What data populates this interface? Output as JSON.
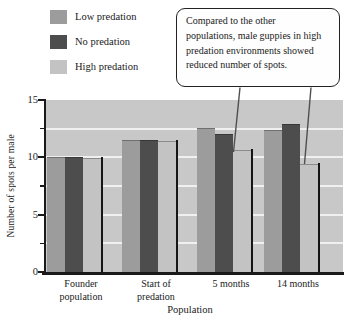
{
  "callout": {
    "text": "Compared to the other populations, male guppies in high predation environments showed reduced number of spots.",
    "lines": [
      "Compared to the other",
      "populations, male guppies in high",
      "predation environments showed",
      "reduced number of spots."
    ]
  },
  "chart_data": {
    "type": "bar",
    "title": "",
    "xlabel": "Population",
    "ylabel": "Number of spots per male",
    "ylim": [
      0,
      15
    ],
    "yticks": [
      0,
      5,
      10,
      15
    ],
    "ytick_labels": [
      "0",
      "5",
      "10",
      "15"
    ],
    "minor_ticks": [
      2.5,
      7.5,
      12.5
    ],
    "gridlines": [
      2.5,
      5,
      7.5,
      10,
      12.5
    ],
    "gridline_color": "#f0f0f0",
    "plot_background": "#c8c8c8",
    "grid": "on",
    "legend_position": "top-left",
    "categories": [
      "Founder population",
      "Start of predation",
      "5 months",
      "14 months"
    ],
    "series": [
      {
        "name": "Low predation",
        "color": "#9c9c9c",
        "values": [
          10.0,
          11.5,
          12.6,
          12.4
        ]
      },
      {
        "name": "No predation",
        "color": "#4d4d4d",
        "values": [
          10.0,
          11.5,
          12.0,
          12.9
        ]
      },
      {
        "name": "High predation",
        "color": "#c3c3c3",
        "values": [
          9.9,
          11.4,
          10.6,
          9.4
        ]
      }
    ],
    "annotation_targets": [
      "5 months / High predation",
      "14 months / High predation"
    ]
  }
}
